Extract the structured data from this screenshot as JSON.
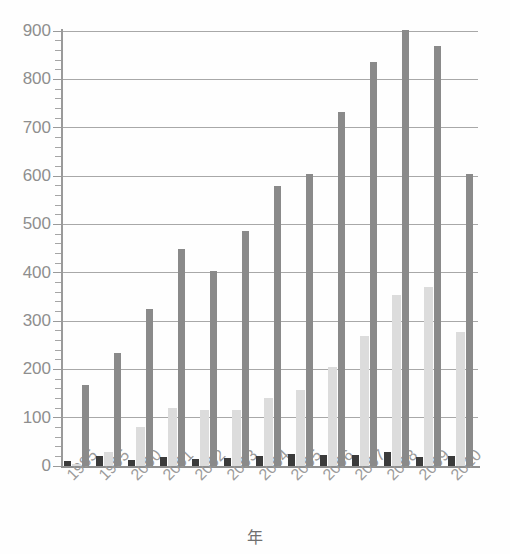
{
  "chart_data": {
    "type": "bar",
    "title": "",
    "subtitle": "",
    "xlabel": "年",
    "ylabel": "",
    "ylim": [
      0,
      900
    ],
    "ytick_step": 100,
    "yticks": [
      0,
      100,
      200,
      300,
      400,
      500,
      600,
      700,
      800,
      900
    ],
    "ytick_labels": [
      "0",
      "100",
      "200",
      "300",
      "400",
      "500",
      "600",
      "700",
      "800",
      "900"
    ],
    "minor_tick_step": 20,
    "grid": true,
    "grid_axis": "y",
    "legend": false,
    "legend_position": "none",
    "categories": [
      "1985",
      "1995",
      "2000",
      "2001",
      "2002",
      "2003",
      "2004",
      "2005",
      "2006",
      "2007",
      "2008",
      "2009",
      "2010"
    ],
    "series": [
      {
        "name": "series-1",
        "color": "#3b3b3b",
        "values": [
          10,
          20,
          12,
          18,
          15,
          17,
          20,
          25,
          22,
          23,
          28,
          18,
          20
        ]
      },
      {
        "name": "series-2",
        "color": "#dcdcdc",
        "values": [
          5,
          30,
          80,
          120,
          115,
          115,
          140,
          158,
          205,
          268,
          353,
          370,
          277
        ]
      },
      {
        "name": "series-3",
        "color": "#8a8a8a",
        "values": [
          167,
          233,
          325,
          448,
          403,
          487,
          580,
          605,
          733,
          835,
          903,
          870,
          605
        ]
      }
    ]
  },
  "colors": {
    "background": "#fefefe",
    "axis": "#9a9a9a",
    "grid": "#a8a8a8",
    "tick_label": "#8e8e8e",
    "x_tick_label": "#9b9b9b",
    "axis_title": "#6f6f6f"
  }
}
